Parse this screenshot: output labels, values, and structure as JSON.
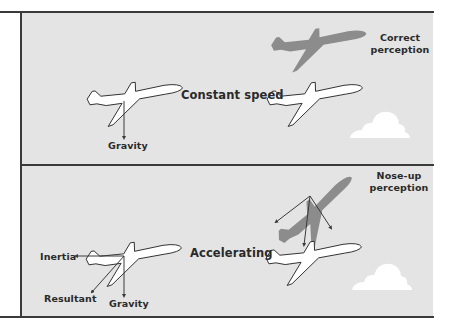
{
  "figure": {
    "background_color": "#e4e4e4",
    "line_color": "#3a3a3a",
    "ghost_plane_color": "#8c8c8c",
    "plane_fill": "#ffffff",
    "cloud_fill": "#ffffff"
  },
  "panels": [
    {
      "id": "constant-speed",
      "state_label": "Constant speed",
      "perception_label_line1": "Correct",
      "perception_label_line2": "perception",
      "forces": [
        {
          "label": "Gravity"
        }
      ]
    },
    {
      "id": "accelerating",
      "state_label": "Accelerating",
      "perception_label_line1": "Nose-up",
      "perception_label_line2": "perception",
      "forces": [
        {
          "label": "Inertia"
        },
        {
          "label": "Resultant"
        },
        {
          "label": "Gravity"
        }
      ]
    }
  ]
}
